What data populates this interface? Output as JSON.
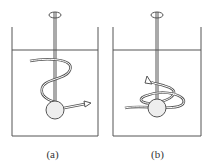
{
  "figure": {
    "panels": [
      {
        "id": "a",
        "label": "(a)",
        "description": "Tank with central shaft and spherical impeller; helical flow path rising from sphere and exiting to the right"
      },
      {
        "id": "b",
        "label": "(b)",
        "description": "Tank with central shaft and spherical impeller; flow loops around the sphere and spirals up the shaft"
      }
    ],
    "colors": {
      "line": "#555555",
      "fill": "#eeeeee",
      "background": "#ffffff"
    }
  }
}
